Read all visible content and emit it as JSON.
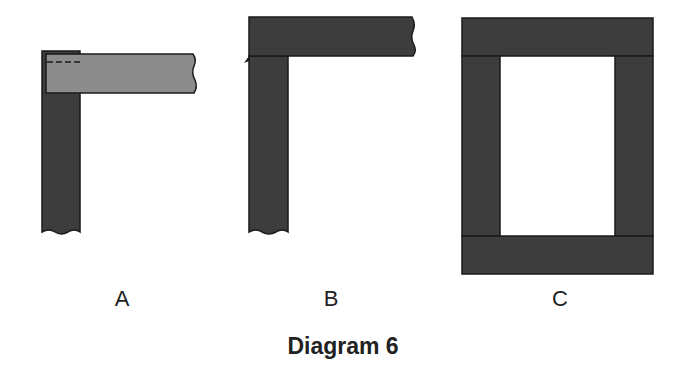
{
  "colors": {
    "dark_wood": "#3d3d3d",
    "light_wood": "#8c8c8c",
    "outline": "#1a1a1a",
    "background": "#ffffff"
  },
  "figures": [
    {
      "id": "A",
      "label": "A",
      "description": "Lap joint: grey horizontal piece lying over dark vertical piece, hidden edge shown dashed"
    },
    {
      "id": "B",
      "label": "B",
      "description": "Corner joint: dark horizontal piece on top of dark vertical piece"
    },
    {
      "id": "C",
      "label": "C",
      "description": "Rectangular frame: top and bottom rails spanning full width, stiles between"
    }
  ],
  "caption": "Diagram 6"
}
